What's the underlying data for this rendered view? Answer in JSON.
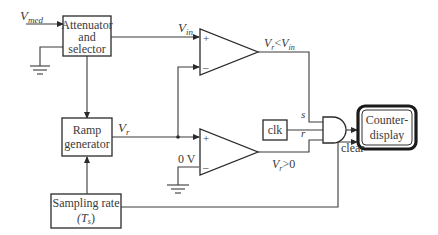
{
  "blocks": {
    "attenuator": {
      "line1": "Attenuator",
      "line2": "and",
      "line3": "selector"
    },
    "ramp": {
      "line1": "Ramp",
      "line2": "generator"
    },
    "sampling": {
      "line1": "Sampling rate",
      "line2": "(T",
      "sub": "s",
      "line2_end": ")"
    },
    "clk": {
      "label": "clk"
    },
    "counter": {
      "line1": "Counter-",
      "line2": "display"
    }
  },
  "signals": {
    "vmed": {
      "main": "V",
      "sub": "med"
    },
    "vin": {
      "main": "V",
      "sub": "in"
    },
    "vr": {
      "main": "V",
      "sub": "r"
    },
    "comp1_out": {
      "a": "V",
      "a_sub": "r",
      "op": "<",
      "b": "V",
      "b_sub": "in"
    },
    "comp2_out": {
      "a": "V",
      "a_sub": "r",
      "op": ">",
      "b": "0"
    },
    "zero_v": "0 V",
    "s": "s",
    "r": "r",
    "clear": "clear",
    "plus": "+",
    "minus": "–"
  },
  "colors": {
    "line": "#3a3a3a",
    "background": "#ffffff"
  }
}
